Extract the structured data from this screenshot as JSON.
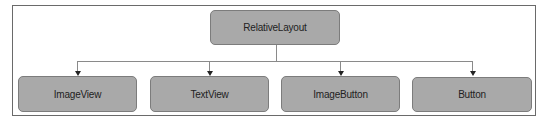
{
  "diagram": {
    "root": {
      "label": "RelativeLayout"
    },
    "children": [
      {
        "label": "ImageView"
      },
      {
        "label": "TextView"
      },
      {
        "label": "ImageButton"
      },
      {
        "label": "Button"
      }
    ]
  },
  "colors": {
    "node_fill": "#a9a9a9",
    "node_border": "#7c7c7c",
    "connector": "#8a8a8a",
    "frame_border": "#6a6a6a"
  }
}
